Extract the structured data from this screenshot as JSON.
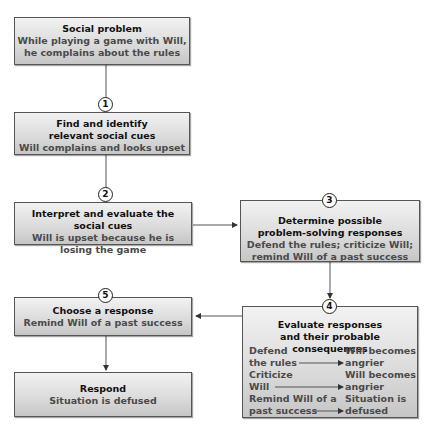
{
  "diagram": {
    "nodes": [
      {
        "id": "problem",
        "title": "Social problem",
        "body": [
          "While playing a game with Will,",
          "he complains about the rules"
        ]
      },
      {
        "id": "step1",
        "number": "1",
        "title": [
          "Find and identify",
          "relevant social cues"
        ],
        "body": [
          "Will complains and looks upset"
        ]
      },
      {
        "id": "step2",
        "number": "2",
        "title": [
          "Interpret and evaluate the social cues"
        ],
        "body": [
          "Will is upset because he is",
          "losing the game"
        ]
      },
      {
        "id": "step3",
        "number": "3",
        "title": [
          "Determine possible",
          "problem-solving responses"
        ],
        "body": [
          "Defend the rules; criticize Will;",
          "remind Will of a past success"
        ]
      },
      {
        "id": "step4",
        "number": "4",
        "title": [
          "Evaluate responses",
          "and their probable consequences"
        ],
        "pairs": [
          {
            "response": [
              "Defend",
              "the rules"
            ],
            "consequence": [
              "Will becomes",
              "angrier"
            ]
          },
          {
            "response": [
              "Criticize",
              "Will"
            ],
            "consequence": [
              "Will becomes",
              "angrier"
            ]
          },
          {
            "response": [
              "Remind Will of a",
              "past success"
            ],
            "consequence": [
              "Situation is",
              "defused"
            ]
          }
        ]
      },
      {
        "id": "step5",
        "number": "5",
        "title": [
          "Choose a response"
        ],
        "body": [
          "Remind Will of a past success"
        ]
      },
      {
        "id": "respond",
        "title": [
          "Respond"
        ],
        "body": [
          "Situation is defused"
        ]
      }
    ],
    "edges": [
      {
        "from": "problem",
        "to": "step1"
      },
      {
        "from": "step1",
        "to": "step2"
      },
      {
        "from": "step2",
        "to": "step3"
      },
      {
        "from": "step3",
        "to": "step4"
      },
      {
        "from": "step4",
        "to": "step5"
      },
      {
        "from": "step5",
        "to": "respond"
      }
    ]
  }
}
